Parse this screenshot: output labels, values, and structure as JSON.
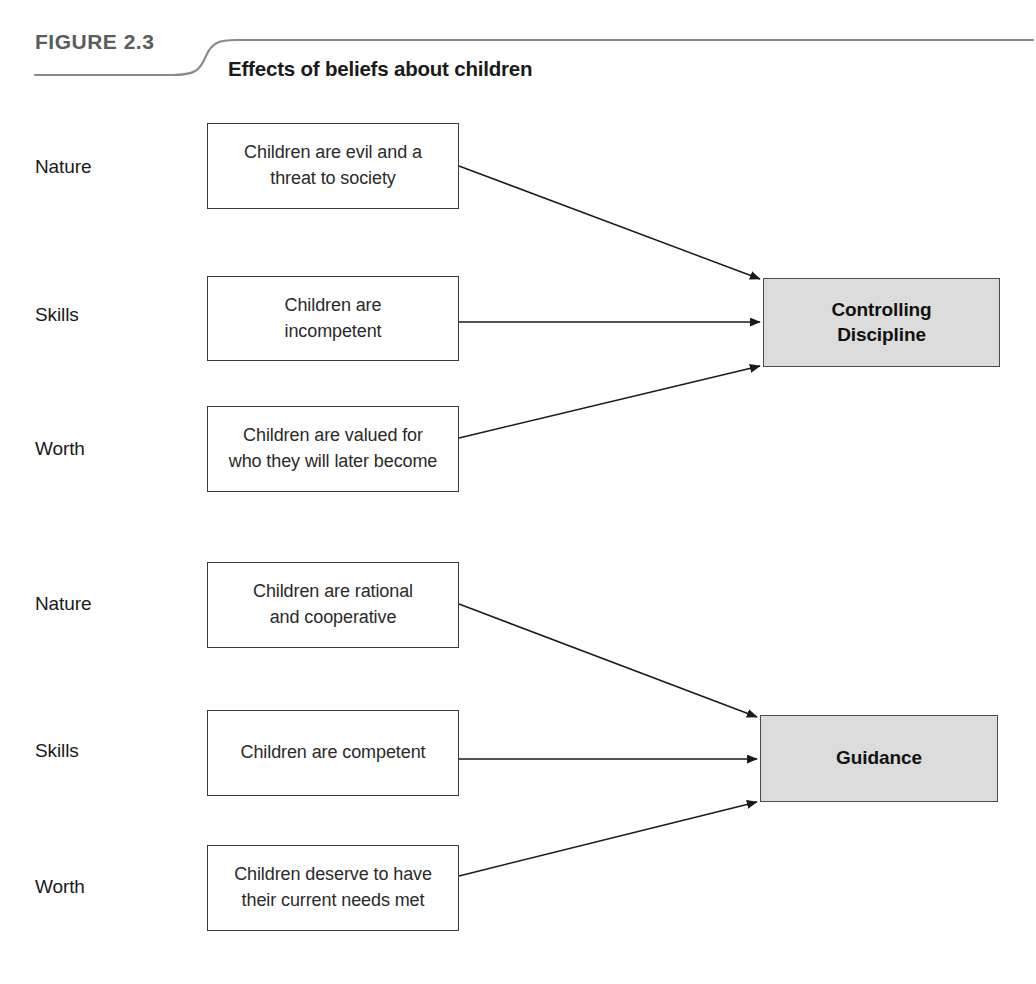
{
  "figure": {
    "label_prefix": "FIGURE",
    "number": "2.3",
    "title": "Effects of beliefs about children"
  },
  "colors": {
    "outcome_fill": "#dcdcdc",
    "box_border": "#3a3a3a",
    "text": "#1a1a1a",
    "figure_label": "#5c5c5c",
    "arrow": "#1a1a1a"
  },
  "groups": [
    {
      "id": "controlling-discipline-group",
      "outcome": {
        "name": "controlling-discipline",
        "line1": "Controlling",
        "line2": "Discipline"
      },
      "beliefs": [
        {
          "category": "Nature",
          "line1": "Children are evil and a",
          "line2": "threat to society"
        },
        {
          "category": "Skills",
          "line1": "Children are",
          "line2": "incompetent"
        },
        {
          "category": "Worth",
          "line1": "Children are valued for",
          "line2": "who they will later become"
        }
      ]
    },
    {
      "id": "guidance-group",
      "outcome": {
        "name": "guidance",
        "line1": "Guidance",
        "line2": ""
      },
      "beliefs": [
        {
          "category": "Nature",
          "line1": "Children are rational",
          "line2": "and cooperative"
        },
        {
          "category": "Skills",
          "line1": "Children are competent",
          "line2": ""
        },
        {
          "category": "Worth",
          "line1": "Children deserve to have",
          "line2": "their current needs met"
        }
      ]
    }
  ]
}
